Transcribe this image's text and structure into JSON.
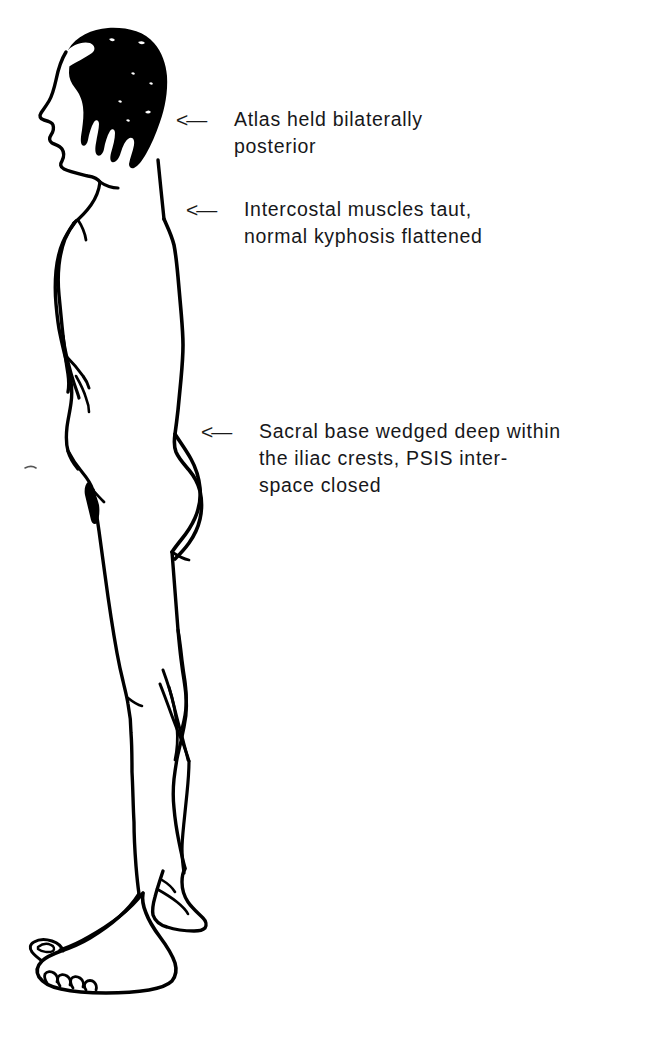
{
  "page": {
    "background_color": "#ffffff",
    "ink_color": "#000000",
    "text_color": "#17171a",
    "width": 672,
    "height": 1039
  },
  "illustration": {
    "name": "standing-male-figure-lateral-view",
    "description": "Line drawing of a nude male figure standing in left-facing lateral profile, full body from head to feet, with solid black hair",
    "orientation": "facing left",
    "style": "pen and ink line drawing"
  },
  "annotations": [
    {
      "arrow": "<—",
      "arrow_name": "leftward-arrow-icon",
      "target": "atlas",
      "lines": [
        "Atlas held bilaterally",
        "posterior"
      ]
    },
    {
      "arrow": "<—",
      "arrow_name": "leftward-arrow-icon",
      "target": "thoracic-spine",
      "lines": [
        "Intercostal muscles taut,",
        "normal kyphosis flattened"
      ]
    },
    {
      "arrow": "<—",
      "arrow_name": "leftward-arrow-icon",
      "target": "sacral-base",
      "lines": [
        "Sacral base wedged deep within",
        "the iliac crests, PSIS inter-",
        "space closed"
      ]
    }
  ]
}
